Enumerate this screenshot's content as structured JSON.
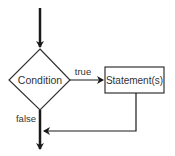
{
  "diagram": {
    "type": "flowchart",
    "nodes": {
      "decision": {
        "shape": "diamond",
        "label": "Condition"
      },
      "process": {
        "shape": "rectangle",
        "label": "Statement(s)"
      }
    },
    "edges": {
      "entry": {
        "from": "start",
        "to": "decision",
        "label": ""
      },
      "true_branch": {
        "from": "decision",
        "to": "process",
        "label": "true"
      },
      "return": {
        "from": "process",
        "to": "exit-line",
        "label": ""
      },
      "false_branch": {
        "from": "decision",
        "to": "exit",
        "label": "false"
      }
    },
    "colors": {
      "stroke": "#1a1a1a",
      "text": "#333333",
      "background": "#ffffff"
    }
  }
}
